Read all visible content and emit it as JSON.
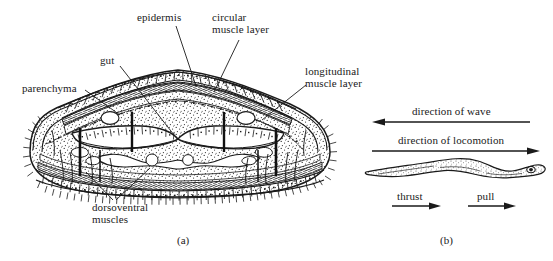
{
  "figure": {
    "background_color": "#ffffff",
    "ink_color": "#1a1a1a"
  },
  "panel_a": {
    "caption": "(a)",
    "labels": {
      "epidermis": "epidermis",
      "circular_muscle_layer": "circular\nmuscle layer",
      "circular_muscle_layer_line1": "circular",
      "circular_muscle_layer_line2": "muscle layer",
      "longitudinal_muscle_layer_line1": "longitudinal",
      "longitudinal_muscle_layer_line2": "muscle layer",
      "gut": "gut",
      "parenchyma": "parenchyma",
      "dorsoventral_muscles_line1": "dorsoventral",
      "dorsoventral_muscles_line2": "muscles"
    }
  },
  "panel_b": {
    "caption": "(b)",
    "labels": {
      "direction_of_wave": "direction of wave",
      "direction_of_locomotion": "direction of locomotion",
      "thrust": "thrust",
      "pull": "pull"
    },
    "arrows": {
      "wave_direction": "left",
      "locomotion_direction": "right",
      "thrust_direction": "right",
      "pull_direction": "right"
    }
  }
}
